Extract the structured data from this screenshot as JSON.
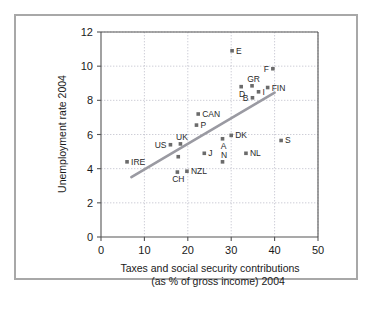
{
  "chart_data": {
    "type": "scatter",
    "title": "",
    "xlabel": "Taxes and social security contributions (as % of gross income) 2004",
    "xlabel_line1": "Taxes and social security contributions",
    "xlabel_line2": "(as % of gross income) 2004",
    "ylabel": "Unemployment rate 2004",
    "xlim": [
      0,
      50
    ],
    "ylim": [
      0,
      12
    ],
    "xticks": [
      0,
      10,
      20,
      30,
      40,
      50
    ],
    "yticks": [
      0,
      2,
      4,
      6,
      8,
      10,
      12
    ],
    "grid": true,
    "legend": "none",
    "marker_color": "#6b6b6b",
    "trendline_color": "#9a9aa2",
    "grid_color": "#b9b9c6",
    "frame_color": "#a8a8a8",
    "points": [
      {
        "label": "IRE",
        "x": 6.0,
        "y": 4.4,
        "label_pos": "right"
      },
      {
        "label": "US",
        "x": 16.0,
        "y": 5.4,
        "label_pos": "left"
      },
      {
        "label": "UK",
        "x": 18.3,
        "y": 5.45,
        "label_pos": "above"
      },
      {
        "label": "",
        "x": 17.8,
        "y": 4.7,
        "label_pos": "none"
      },
      {
        "label": "CH",
        "x": 17.6,
        "y": 3.8,
        "label_pos": "below"
      },
      {
        "label": "NZL",
        "x": 19.8,
        "y": 3.85,
        "label_pos": "right"
      },
      {
        "label": "P",
        "x": 22.0,
        "y": 6.55,
        "label_pos": "right"
      },
      {
        "label": "CAN",
        "x": 22.4,
        "y": 7.2,
        "label_pos": "right"
      },
      {
        "label": "J",
        "x": 23.8,
        "y": 4.9,
        "label_pos": "right"
      },
      {
        "label": "A",
        "x": 28.0,
        "y": 5.75,
        "label_pos": "below"
      },
      {
        "label": "N",
        "x": 28.0,
        "y": 4.4,
        "label_pos": "above"
      },
      {
        "label": "DK",
        "x": 30.0,
        "y": 5.95,
        "label_pos": "right"
      },
      {
        "label": "E",
        "x": 30.2,
        "y": 10.9,
        "label_pos": "right"
      },
      {
        "label": "NL",
        "x": 33.4,
        "y": 4.9,
        "label_pos": "right"
      },
      {
        "label": "D",
        "x": 32.3,
        "y": 8.8,
        "label_pos": "below"
      },
      {
        "label": "GR",
        "x": 34.8,
        "y": 8.85,
        "label_pos": "above"
      },
      {
        "label": "B",
        "x": 34.9,
        "y": 8.15,
        "label_pos": "left"
      },
      {
        "label": "I",
        "x": 36.3,
        "y": 8.5,
        "label_pos": "right"
      },
      {
        "label": "FIN",
        "x": 38.4,
        "y": 8.75,
        "label_pos": "right"
      },
      {
        "label": "F",
        "x": 39.6,
        "y": 9.85,
        "label_pos": "left"
      },
      {
        "label": "S",
        "x": 41.5,
        "y": 5.65,
        "label_pos": "right"
      }
    ],
    "trendline": {
      "x1": 7.0,
      "y1": 3.5,
      "x2": 40.0,
      "y2": 8.45
    }
  }
}
